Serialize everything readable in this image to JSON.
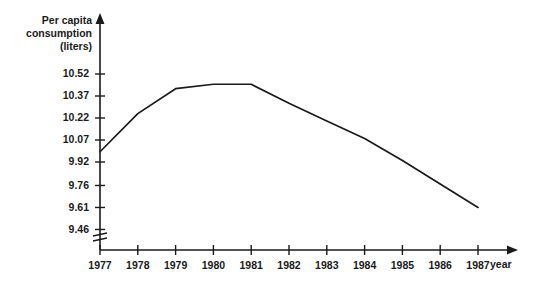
{
  "chart_data": {
    "type": "line",
    "title": "",
    "xlabel": "year",
    "ylabel": "Per capita consumption (liters)",
    "ylabel_lines": [
      "Per capita",
      "consumption",
      "(liters)"
    ],
    "categories": [
      "1977",
      "1978",
      "1979",
      "1980",
      "1981",
      "1982",
      "1983",
      "1984",
      "1985",
      "1986",
      "1987"
    ],
    "x": [
      1977,
      1978,
      1979,
      1980,
      1981,
      1982,
      1983,
      1984,
      1985,
      1986,
      1987
    ],
    "values": [
      9.99,
      10.25,
      10.42,
      10.45,
      10.45,
      10.32,
      10.2,
      10.08,
      9.93,
      9.77,
      9.61
    ],
    "series": [
      {
        "name": "Per capita consumption",
        "values": [
          9.99,
          10.25,
          10.42,
          10.45,
          10.45,
          10.32,
          10.2,
          10.08,
          9.93,
          9.77,
          9.61
        ]
      }
    ],
    "ytick_labels": [
      "10.52",
      "10.37",
      "10.22",
      "10.07",
      "9.92",
      "9.76",
      "9.61",
      "9.46"
    ],
    "yticks": [
      10.52,
      10.37,
      10.22,
      10.07,
      9.92,
      9.76,
      9.61,
      9.46
    ],
    "ylim": [
      9.46,
      10.52
    ],
    "xlim": [
      1977,
      1987
    ],
    "grid": false,
    "legend": false,
    "legend_position": "none",
    "axis_break": true,
    "line_color": "#1a1a1a",
    "background_color": "#ffffff"
  },
  "axis": {
    "y_arrow": "arrow-up-icon",
    "x_arrow": "arrow-right-icon",
    "break_symbol": "axis-break-icon"
  }
}
